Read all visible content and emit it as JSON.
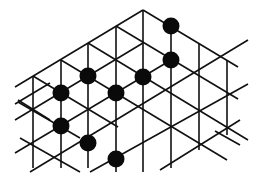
{
  "diagram": {
    "type": "triangular-lattice-with-stones",
    "canvas": {
      "width": 261,
      "height": 184
    },
    "colors": {
      "line": "#111111",
      "stone": "#0a0a0a",
      "background": "#ffffff"
    },
    "stone_radius": 8.5,
    "lines": [
      [
        15,
        87,
        143,
        10
      ],
      [
        143,
        10,
        238,
        67
      ],
      [
        33,
        76,
        33,
        168
      ],
      [
        61,
        60,
        61,
        168
      ],
      [
        88,
        43,
        88,
        168
      ],
      [
        116,
        26,
        116,
        172
      ],
      [
        143,
        10,
        143,
        172
      ],
      [
        171,
        26,
        171,
        168
      ],
      [
        199,
        43,
        199,
        150
      ],
      [
        227,
        60,
        227,
        135
      ],
      [
        33,
        76,
        118,
        127
      ],
      [
        61,
        60,
        227,
        160
      ],
      [
        88,
        43,
        248,
        140
      ],
      [
        116,
        26,
        238,
        99
      ],
      [
        18,
        100,
        50,
        120
      ],
      [
        20,
        138,
        80,
        172
      ],
      [
        18,
        102,
        80,
        138
      ],
      [
        15,
        120,
        143,
        43
      ],
      [
        15,
        153,
        171,
        60
      ],
      [
        30,
        172,
        248,
        40
      ],
      [
        90,
        172,
        248,
        84
      ],
      [
        160,
        170,
        240,
        120
      ],
      [
        15,
        104,
        50,
        83
      ],
      [
        215,
        131,
        240,
        145
      ]
    ],
    "stones": [
      {
        "x": 171,
        "y": 26
      },
      {
        "x": 171,
        "y": 60
      },
      {
        "x": 143,
        "y": 77
      },
      {
        "x": 88,
        "y": 76
      },
      {
        "x": 116,
        "y": 93
      },
      {
        "x": 61,
        "y": 93
      },
      {
        "x": 61,
        "y": 126
      },
      {
        "x": 88,
        "y": 143
      },
      {
        "x": 116,
        "y": 159
      }
    ]
  }
}
